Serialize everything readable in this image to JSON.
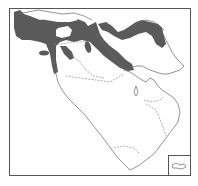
{
  "map": {
    "title": "Species distribution map — Middle East",
    "region": "Middle East (Turkey, Caucasus, Iran, Iraq, Levant, Arabian Peninsula)",
    "legend": {
      "range_color": "#5a5a5a",
      "range_label": "Distribution range"
    },
    "shaded_regions": [
      "Turkey (Anatolia, excluding central plateau)",
      "Cyprus",
      "Western Levant / Lebanon",
      "Northern Iraq / Zagros",
      "Southern Caucasus",
      "Northern Iran (Alborz)"
    ],
    "inset": {
      "label": "Socotra inset"
    },
    "colors": {
      "background": "#ffffff",
      "frame": "#555555",
      "coastline": "#666666",
      "range": "#5a5a5a"
    }
  }
}
